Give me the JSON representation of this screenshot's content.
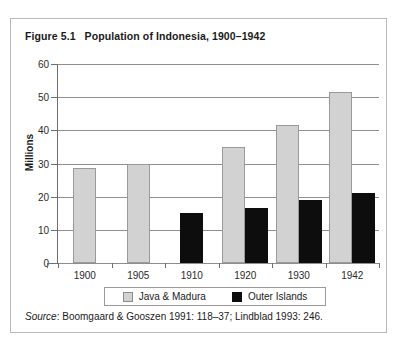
{
  "figure": {
    "number": "Figure 5.1",
    "title": "Population of Indonesia, 1900–1942"
  },
  "source": {
    "label": "Source",
    "separator": ": ",
    "text": "Boomgaard & Gooszen 1991: 118–37; Lindblad 1993: 246."
  },
  "colors": {
    "java_fill": "#d2d2d2",
    "java_border": "#9a9a9a",
    "outer_fill": "#0d0d0d",
    "gridline": "#8e8e8e",
    "axis": "#6e6e6e",
    "frame": "#b9b9b9",
    "text": "#1a1a1a"
  },
  "chart_data": {
    "type": "bar",
    "title": "Population of Indonesia, 1900–1942",
    "xlabel": "",
    "ylabel": "Millions",
    "ylim": [
      0,
      60
    ],
    "yticks": [
      0,
      10,
      20,
      30,
      40,
      50,
      60
    ],
    "grid": true,
    "legend_position": "bottom",
    "categories": [
      "1900",
      "1905",
      "1910",
      "1920",
      "1930",
      "1942"
    ],
    "series": [
      {
        "name": "Java & Madura",
        "color": "#d2d2d2",
        "values": [
          28.5,
          30.0,
          null,
          35.0,
          41.5,
          51.5
        ]
      },
      {
        "name": "Outer Islands",
        "color": "#0d0d0d",
        "values": [
          null,
          null,
          15.0,
          16.5,
          19.0,
          21.0
        ]
      }
    ]
  }
}
